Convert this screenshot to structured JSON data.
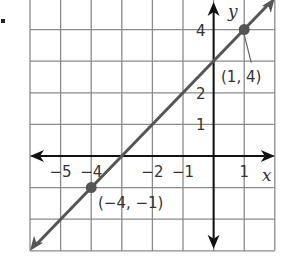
{
  "problem_marker": ".",
  "graph": {
    "x_axis_label": "x",
    "y_axis_label": "y",
    "x_range": [
      -6,
      2
    ],
    "y_range": [
      -3,
      5
    ],
    "x_tick_labels": [
      "−5",
      "−4",
      "−2",
      "−1",
      "1"
    ],
    "y_tick_labels": [
      "4",
      "2",
      "1"
    ],
    "colors": {
      "grid": "#8a8a8a",
      "axis": "#111111",
      "line": "#555555",
      "point": "#555555"
    }
  },
  "chart_data": {
    "type": "line",
    "title": "",
    "xlabel": "x",
    "ylabel": "y",
    "xlim": [
      -6,
      2
    ],
    "ylim": [
      -3,
      5
    ],
    "grid": true,
    "series": [
      {
        "name": "line through (−4, −1) and (1, 4)",
        "equation": "y = x + 3",
        "x": [
          -4,
          1
        ],
        "y": [
          -1,
          4
        ]
      }
    ],
    "points": [
      {
        "label": "(−4, −1)",
        "x": -4,
        "y": -1
      },
      {
        "label": "(1, 4)",
        "x": 1,
        "y": 4
      }
    ],
    "x_tick_labels": [
      -5,
      -4,
      -2,
      -1,
      1
    ],
    "y_tick_labels": [
      1,
      2,
      4
    ]
  },
  "annotations": {
    "point_a": "(−4, −1)",
    "point_b": "(1, 4)"
  }
}
